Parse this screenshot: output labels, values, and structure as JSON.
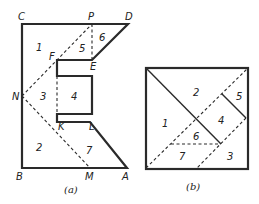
{
  "figure_a": {
    "caption": "(a)",
    "points": {
      "C": "C",
      "P": "P",
      "D": "D",
      "E": "E",
      "F": "F",
      "N": "N",
      "K": "K",
      "L": "L",
      "B": "B",
      "M": "M",
      "A": "A"
    },
    "pieces": [
      "1",
      "2",
      "3",
      "4",
      "5",
      "6",
      "7"
    ]
  },
  "figure_b": {
    "caption": "(b)",
    "pieces": [
      "1",
      "2",
      "3",
      "4",
      "5",
      "6",
      "7"
    ]
  }
}
